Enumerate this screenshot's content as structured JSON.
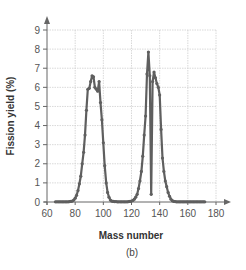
{
  "chart_data": {
    "type": "line",
    "title": "",
    "caption": "(b)",
    "xlabel": "Mass number",
    "ylabel": "Fission yield (%)",
    "xlim": [
      60,
      180
    ],
    "ylim": [
      0,
      9
    ],
    "xticks": [
      60,
      80,
      100,
      120,
      140,
      160,
      180
    ],
    "yticks": [
      0,
      1,
      2,
      3,
      4,
      5,
      6,
      7,
      8,
      9
    ],
    "grid": true,
    "legend": null,
    "series": [
      {
        "name": "Fission yield",
        "color": "#5f5f5f",
        "marker": "circle",
        "x": [
          66,
          67,
          68,
          69,
          70,
          71,
          72,
          73,
          74,
          75,
          76,
          77,
          78,
          79,
          80,
          81,
          82,
          83,
          84,
          85,
          86,
          87,
          88,
          89,
          90,
          91,
          92,
          93,
          94,
          95,
          96,
          97,
          98,
          99,
          100,
          101,
          102,
          103,
          104,
          105,
          106,
          107,
          108,
          109,
          110,
          111,
          112,
          113,
          114,
          115,
          116,
          117,
          118,
          119,
          120,
          121,
          122,
          123,
          124,
          125,
          126,
          127,
          128,
          129,
          130,
          131,
          132,
          133,
          134,
          135,
          136,
          137,
          138,
          139,
          140,
          141,
          142,
          143,
          144,
          145,
          146,
          147,
          148,
          149,
          150,
          151,
          152,
          153,
          154,
          155,
          156,
          157,
          158,
          159,
          160,
          161,
          162,
          163,
          164,
          165,
          166,
          167,
          168,
          169,
          170,
          171,
          172
        ],
        "y": [
          0.01,
          0.01,
          0.01,
          0.01,
          0.01,
          0.01,
          0.01,
          0.01,
          0.01,
          0.01,
          0.02,
          0.03,
          0.05,
          0.1,
          0.2,
          0.35,
          0.6,
          0.95,
          1.35,
          2.0,
          2.6,
          3.5,
          4.8,
          5.9,
          5.95,
          6.3,
          6.6,
          6.55,
          6.0,
          5.9,
          5.8,
          6.3,
          5.2,
          4.3,
          3.1,
          1.9,
          1.0,
          0.5,
          0.25,
          0.1,
          0.05,
          0.03,
          0.02,
          0.02,
          0.01,
          0.01,
          0.01,
          0.01,
          0.01,
          0.01,
          0.01,
          0.01,
          0.02,
          0.03,
          0.05,
          0.08,
          0.15,
          0.25,
          0.4,
          0.7,
          1.1,
          1.6,
          2.4,
          3.5,
          4.5,
          6.7,
          7.85,
          6.6,
          0.4,
          6.3,
          6.8,
          6.5,
          6.2,
          6.0,
          5.6,
          3.8,
          2.3,
          1.6,
          1.1,
          0.8,
          0.5,
          0.3,
          0.15,
          0.07,
          0.03,
          0.02,
          0.01,
          0.01,
          0.01,
          0.01,
          0.01,
          0.01,
          0.01,
          0.01,
          0.01,
          0.01,
          0.01,
          0.01,
          0.01,
          0.01,
          0.01,
          0.01,
          0.01,
          0.01,
          0.01,
          0.01,
          0.01
        ]
      }
    ]
  }
}
